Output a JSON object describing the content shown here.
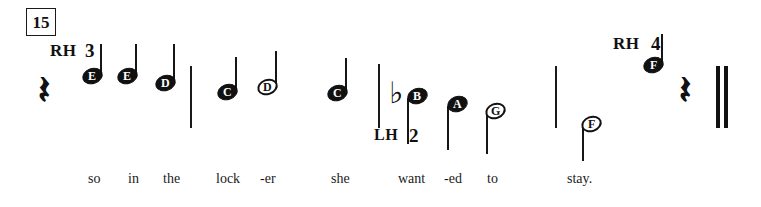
{
  "page": {
    "kind": "music-notation-excerpt",
    "width": 761,
    "height": 207,
    "background": "#ffffff",
    "ink_color": "#111111"
  },
  "measure_number": {
    "label": "15",
    "x": 26,
    "y": 8,
    "w": 28,
    "h": 26,
    "font_size": 17
  },
  "hand_labels": [
    {
      "name": "rh-label-left",
      "text": "RH",
      "x": 50,
      "y": 42,
      "font_size": 17
    },
    {
      "name": "lh-label",
      "text": "LH",
      "x": 374,
      "y": 127,
      "font_size": 16
    },
    {
      "name": "rh-label-right",
      "text": "RH",
      "x": 613,
      "y": 35,
      "font_size": 17
    }
  ],
  "finger_numbers": [
    {
      "name": "finger-3",
      "text": "3",
      "x": 85,
      "y": 41,
      "font_size": 19
    },
    {
      "name": "finger-2",
      "text": "2",
      "x": 409,
      "y": 126,
      "font_size": 19
    },
    {
      "name": "finger-4",
      "text": "4",
      "x": 651,
      "y": 34,
      "font_size": 19
    }
  ],
  "barlines": [
    {
      "name": "barline-1",
      "x": 190,
      "y": 66,
      "h": 62,
      "w": 2
    },
    {
      "name": "barline-2",
      "x": 378,
      "y": 64,
      "h": 64,
      "w": 2
    },
    {
      "name": "barline-3",
      "x": 555,
      "y": 66,
      "h": 62,
      "w": 2
    }
  ],
  "final_barline": {
    "name": "final-barline",
    "x": 716,
    "y": 66,
    "h": 62,
    "bars": [
      {
        "left": 0,
        "w": 4
      },
      {
        "left": 8,
        "w": 4
      }
    ]
  },
  "rests": [
    {
      "name": "quarter-rest-1",
      "glyph": "𝄽",
      "x": 38,
      "y": 70,
      "font_size": 40
    },
    {
      "name": "quarter-rest-2",
      "glyph": "𝄽",
      "x": 679,
      "y": 70,
      "font_size": 40
    }
  ],
  "accidentals": [
    {
      "name": "flat-sign-b",
      "glyph": "♭",
      "pitch": "B",
      "x": 389,
      "y": 78,
      "font_size": 30
    }
  ],
  "notes": [
    {
      "name": "note-e-1",
      "pitch": "E",
      "filled": true,
      "stem": "up",
      "head_x": 82,
      "head_y": 68,
      "stem_x": 100,
      "stem_y": 44,
      "stem_h": 34
    },
    {
      "name": "note-e-2",
      "pitch": "E",
      "filled": true,
      "stem": "up",
      "head_x": 117,
      "head_y": 68,
      "stem_x": 135,
      "stem_y": 44,
      "stem_h": 34
    },
    {
      "name": "note-d-1",
      "pitch": "D",
      "filled": true,
      "stem": "up",
      "head_x": 155,
      "head_y": 75,
      "stem_x": 173,
      "stem_y": 44,
      "stem_h": 41
    },
    {
      "name": "note-c-1",
      "pitch": "C",
      "filled": true,
      "stem": "up",
      "head_x": 217,
      "head_y": 84,
      "stem_x": 235,
      "stem_y": 57,
      "stem_h": 37
    },
    {
      "name": "note-d-2",
      "pitch": "D",
      "filled": false,
      "stem": "up",
      "head_x": 257,
      "head_y": 79,
      "stem_x": 275,
      "stem_y": 51,
      "stem_h": 38
    },
    {
      "name": "note-c-2",
      "pitch": "C",
      "filled": true,
      "stem": "up",
      "head_x": 327,
      "head_y": 85,
      "stem_x": 345,
      "stem_y": 58,
      "stem_h": 37
    },
    {
      "name": "note-b-1",
      "pitch": "B",
      "filled": true,
      "stem": "down",
      "head_x": 407,
      "head_y": 88,
      "stem_x": 407,
      "stem_y": 98,
      "stem_h": 46
    },
    {
      "name": "note-a-1",
      "pitch": "A",
      "filled": true,
      "stem": "down",
      "head_x": 447,
      "head_y": 96,
      "stem_x": 447,
      "stem_y": 106,
      "stem_h": 44
    },
    {
      "name": "note-g-1",
      "pitch": "G",
      "filled": false,
      "stem": "down",
      "head_x": 485,
      "head_y": 103,
      "stem_x": 486,
      "stem_y": 114,
      "stem_h": 40
    },
    {
      "name": "note-f-1",
      "pitch": "F",
      "filled": false,
      "stem": "down",
      "head_x": 581,
      "head_y": 116,
      "stem_x": 582,
      "stem_y": 127,
      "stem_h": 34
    },
    {
      "name": "note-f-2",
      "pitch": "F",
      "filled": true,
      "stem": "up",
      "head_x": 643,
      "head_y": 57,
      "stem_x": 661,
      "stem_y": 34,
      "stem_h": 33
    }
  ],
  "note_head": {
    "w": 21,
    "h": 16,
    "font_size": 12
  },
  "lyrics": {
    "baseline_y": 172,
    "font_size": 14,
    "syllables": [
      {
        "name": "lyric-so",
        "text": "so",
        "x": 88
      },
      {
        "name": "lyric-in",
        "text": "in",
        "x": 128
      },
      {
        "name": "lyric-the",
        "text": "the",
        "x": 163
      },
      {
        "name": "lyric-lock",
        "text": "lock",
        "x": 216
      },
      {
        "name": "lyric-er",
        "text": "-er",
        "x": 260
      },
      {
        "name": "lyric-she",
        "text": "she",
        "x": 331
      },
      {
        "name": "lyric-want",
        "text": "want",
        "x": 398
      },
      {
        "name": "lyric-ed",
        "text": "-ed",
        "x": 444
      },
      {
        "name": "lyric-to",
        "text": "to",
        "x": 487
      },
      {
        "name": "lyric-stay",
        "text": "stay.",
        "x": 567
      }
    ]
  }
}
